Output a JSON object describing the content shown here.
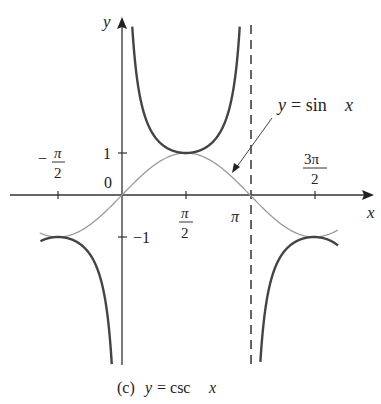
{
  "chart_data": {
    "type": "line",
    "title": "",
    "caption": "(c) y = csc x",
    "xlabel": "x",
    "ylabel": "y",
    "x_ticks": [
      {
        "value": -1.5708,
        "label": "-π/2"
      },
      {
        "value": 1.5708,
        "label": "π/2"
      },
      {
        "value": 3.14159,
        "label": "π"
      },
      {
        "value": 4.71239,
        "label": "3π/2"
      }
    ],
    "y_ticks": [
      {
        "value": 1,
        "label": "1"
      },
      {
        "value": -1,
        "label": "-1"
      }
    ],
    "origin_label": "0",
    "xlim": [
      -1.95,
      3.95
    ],
    "ylim": [
      -4.0,
      4.1
    ],
    "series": [
      {
        "name": "y = csc x",
        "style": "thick dark",
        "color": "#444444",
        "segments": [
          {
            "x_range": [
              -2.0,
              0.0
            ],
            "asymptote_end": 0
          },
          {
            "x_range": [
              0.0,
              3.14159
            ],
            "asymptote_start": 0,
            "asymptote_end": 3.14159
          },
          {
            "x_range": [
              3.14159,
              5.3
            ],
            "asymptote_start": 3.14159
          }
        ]
      },
      {
        "name": "y = sin x",
        "style": "thin light",
        "color": "#9a9a9a",
        "x_range": [
          -2.0,
          5.3
        ]
      }
    ],
    "asymptotes": [
      {
        "x": 3.14159,
        "style": "dashed"
      }
    ],
    "annotations": [
      {
        "text": "y = sin x",
        "arrow_to": {
          "x": 2.5,
          "y": 0.55
        }
      }
    ],
    "grid": false,
    "legend": "none"
  },
  "labels": {
    "y_axis": "y",
    "x_axis": "x",
    "origin": "0",
    "tick_one": "1",
    "tick_neg_one": "−1",
    "neg_pi_half_minus": "−",
    "pi": "π",
    "two": "2",
    "three_pi": "3π",
    "sin_label_y": "y",
    "sin_label_rest": "= sin",
    "sin_label_x": "x",
    "caption_c": "(c)",
    "caption_y": "y",
    "caption_eq": "= csc",
    "caption_x": "x"
  }
}
